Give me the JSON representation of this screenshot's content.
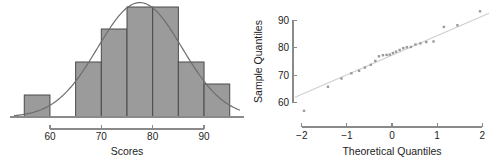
{
  "figure": {
    "width": 498,
    "height": 168,
    "background": "#ffffff",
    "panels": [
      "histogram",
      "qq-plot"
    ]
  },
  "colors": {
    "bar_fill": "#9b9b9b",
    "bar_stroke": "#4a4a4a",
    "curve": "#6d6d6d",
    "axis": "#8a8a8a",
    "point": "#9a9a9a",
    "ref_line": "#cfcfcf",
    "text": "#1d1d1d"
  },
  "chart_data": [
    {
      "id": "histogram",
      "type": "bar",
      "title": "",
      "xlabel": "Scores",
      "ylabel": "",
      "xlim": [
        53,
        97
      ],
      "ylim": [
        0,
        10
      ],
      "grid": false,
      "legend": null,
      "xticks": [
        60,
        70,
        80,
        90
      ],
      "xticklabels": [
        "60",
        "70",
        "80",
        "90"
      ],
      "yticks": [],
      "yticklabels": [],
      "bin_width": 5,
      "bin_edges": [
        55,
        60,
        65,
        70,
        75,
        80,
        85,
        90,
        95
      ],
      "categories": [
        "55-60",
        "60-65",
        "65-70",
        "70-75",
        "75-80",
        "80-85",
        "85-90",
        "90-95"
      ],
      "values": [
        2,
        0,
        5,
        8,
        10,
        10,
        5,
        3
      ],
      "series": [
        {
          "name": "Frequency",
          "values": [
            2,
            0,
            5,
            8,
            10,
            10,
            5,
            3
          ]
        }
      ],
      "overlay": {
        "name": "Normal density curve",
        "type": "line",
        "mean": 77.5,
        "sd": 8.2,
        "peak_value": 10.4,
        "x_range": [
          53,
          97
        ]
      }
    },
    {
      "id": "qq-plot",
      "type": "scatter",
      "title": "",
      "xlabel": "Theoretical Quantiles",
      "ylabel": "Sample Quantiles",
      "xlim": [
        -2.15,
        2.15
      ],
      "ylim": [
        55.5,
        94.5
      ],
      "grid": false,
      "legend": null,
      "xticks": [
        -2,
        -1,
        0,
        1,
        2
      ],
      "xticklabels": [
        "−2",
        "−1",
        "0",
        "1",
        "2"
      ],
      "yticks": [
        60,
        70,
        80,
        90
      ],
      "yticklabels": [
        "60",
        "70",
        "80",
        "90"
      ],
      "reference_line": {
        "name": "qq reference line",
        "x": [
          -2.15,
          2.15
        ],
        "y": [
          62.0,
          92.6
        ]
      },
      "x": [
        -1.95,
        -1.42,
        -1.12,
        -0.9,
        -0.73,
        -0.6,
        -0.47,
        -0.37,
        -0.29,
        -0.2,
        -0.12,
        -0.05,
        0.02,
        0.09,
        0.17,
        0.25,
        0.33,
        0.42,
        0.52,
        0.63,
        0.76,
        0.92,
        1.15,
        1.45,
        1.95
      ],
      "y": [
        57.0,
        65.8,
        68.8,
        70.7,
        71.6,
        72.8,
        73.8,
        75.2,
        76.9,
        77.3,
        77.4,
        77.5,
        78.1,
        78.6,
        79.2,
        79.9,
        80.2,
        80.3,
        81.2,
        81.6,
        82.1,
        82.3,
        87.6,
        88.2,
        93.3
      ],
      "n_points": 25
    }
  ]
}
